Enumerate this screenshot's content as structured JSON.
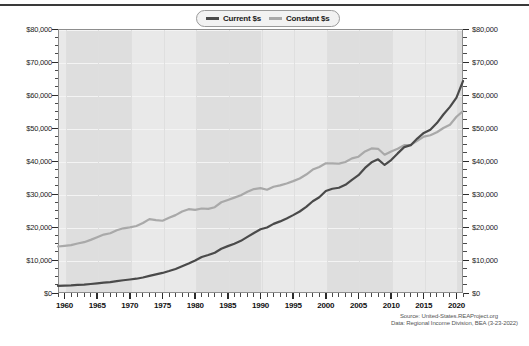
{
  "chart_data": {
    "type": "line",
    "title": "",
    "xlabel": "",
    "ylabel": "",
    "xlim": [
      1959,
      2021
    ],
    "ylim": [
      0,
      80000
    ],
    "ytick_labels": [
      "$0",
      "$10,000",
      "$20,000",
      "$30,000",
      "$40,000",
      "$50,000",
      "$60,000",
      "$70,000",
      "$80,000"
    ],
    "ytick_values": [
      0,
      10000,
      20000,
      30000,
      40000,
      50000,
      60000,
      70000,
      80000
    ],
    "xtick_labels": [
      "1960",
      "1965",
      "1970",
      "1975",
      "1980",
      "1985",
      "1990",
      "1995",
      "2000",
      "2005",
      "2010",
      "2015",
      "2020"
    ],
    "xtick_values": [
      1960,
      1965,
      1970,
      1975,
      1980,
      1985,
      1990,
      1995,
      2000,
      2005,
      2010,
      2015,
      2020
    ],
    "grid": true,
    "legend_position": "top-center",
    "x": [
      1959,
      1960,
      1961,
      1962,
      1963,
      1964,
      1965,
      1966,
      1967,
      1968,
      1969,
      1970,
      1971,
      1972,
      1973,
      1974,
      1975,
      1976,
      1977,
      1978,
      1979,
      1980,
      1981,
      1982,
      1983,
      1984,
      1985,
      1986,
      1987,
      1988,
      1989,
      1990,
      1991,
      1992,
      1993,
      1994,
      1995,
      1996,
      1997,
      1998,
      1999,
      2000,
      2001,
      2002,
      2003,
      2004,
      2005,
      2006,
      2007,
      2008,
      2009,
      2010,
      2011,
      2012,
      2013,
      2014,
      2015,
      2016,
      2017,
      2018,
      2019,
      2020,
      2021
    ],
    "series": [
      {
        "name": "Current $s",
        "color": "#4a4a4a",
        "values": [
          2150,
          2250,
          2310,
          2450,
          2550,
          2720,
          2920,
          3140,
          3310,
          3590,
          3870,
          4090,
          4330,
          4700,
          5200,
          5660,
          6080,
          6650,
          7280,
          8100,
          8950,
          9850,
          10900,
          11500,
          12200,
          13400,
          14200,
          14950,
          15800,
          17000,
          18200,
          19300,
          19850,
          20950,
          21700,
          22600,
          23600,
          24700,
          26100,
          27800,
          29000,
          30900,
          31600,
          31900,
          32800,
          34300,
          35700,
          37900,
          39600,
          40500,
          38800,
          40300,
          42300,
          44200,
          44800,
          46800,
          48500,
          49500,
          51500,
          54100,
          56400,
          59200,
          64200
        ]
      },
      {
        "name": "Constant $s",
        "color": "#a9a9a9",
        "values": [
          14100,
          14300,
          14500,
          15000,
          15400,
          16100,
          16900,
          17700,
          18100,
          19000,
          19600,
          19900,
          20300,
          21200,
          22400,
          22100,
          21900,
          22800,
          23600,
          24700,
          25400,
          25200,
          25600,
          25500,
          26000,
          27500,
          28200,
          28900,
          29600,
          30700,
          31500,
          31800,
          31300,
          32200,
          32600,
          33200,
          33900,
          34700,
          35900,
          37400,
          38200,
          39300,
          39300,
          39200,
          39700,
          40800,
          41300,
          42900,
          43800,
          43700,
          41900,
          42900,
          43700,
          44800,
          44900,
          46100,
          47400,
          47800,
          48700,
          50000,
          51000,
          53400,
          55100
        ]
      }
    ],
    "recession_bands": [
      {
        "start": 1960,
        "end": 1970
      },
      {
        "start": 1980,
        "end": 1990
      },
      {
        "start": 2000,
        "end": 2010
      },
      {
        "start": 2020,
        "end": 2021
      }
    ]
  },
  "legend": {
    "items": [
      {
        "label": "Current $s",
        "color": "#4a4a4a"
      },
      {
        "label": "Constant $s",
        "color": "#a9a9a9"
      }
    ]
  },
  "source": {
    "line1": "Source: United-States.REAProject.org",
    "line2": "Data: Regional Income Division, BEA (3-23-2022)"
  }
}
